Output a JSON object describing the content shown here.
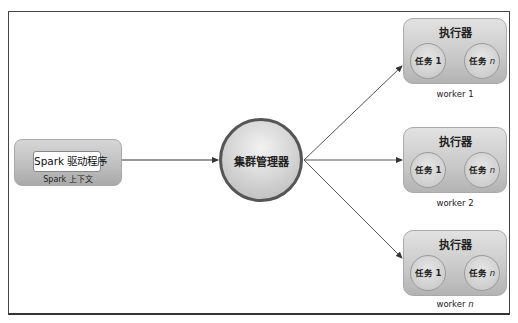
{
  "diagram": {
    "type": "spark-cluster-architecture",
    "driver": {
      "program_label": "Spark 驱动程序",
      "context_label": "Spark 上下文"
    },
    "cluster_manager": {
      "label": "集群管理器"
    },
    "workers": [
      {
        "name": "worker 1",
        "name_prefix": "worker ",
        "name_suffix": "1",
        "suffix_italic": false,
        "executor_label": "执行器",
        "tasks": [
          {
            "prefix": "任务 ",
            "suffix": "1",
            "italic": false
          },
          {
            "prefix": "任务 ",
            "suffix": "n",
            "italic": true
          }
        ]
      },
      {
        "name": "worker 2",
        "name_prefix": "worker ",
        "name_suffix": "2",
        "suffix_italic": false,
        "executor_label": "执行器",
        "tasks": [
          {
            "prefix": "任务 ",
            "suffix": "1",
            "italic": false
          },
          {
            "prefix": "任务 ",
            "suffix": "n",
            "italic": true
          }
        ]
      },
      {
        "name": "worker n",
        "name_prefix": "worker ",
        "name_suffix": "n",
        "suffix_italic": true,
        "executor_label": "执行器",
        "tasks": [
          {
            "prefix": "任务 ",
            "suffix": "1",
            "italic": false
          },
          {
            "prefix": "任务 ",
            "suffix": "n",
            "italic": true
          }
        ]
      }
    ],
    "edges": [
      {
        "from": "driver",
        "to": "cluster_manager"
      },
      {
        "from": "cluster_manager",
        "to": "worker 1"
      },
      {
        "from": "cluster_manager",
        "to": "worker 2"
      },
      {
        "from": "cluster_manager",
        "to": "worker n"
      }
    ],
    "colors": {
      "frame_border": "#444444",
      "node_fill": "#c8c8c8",
      "cluster_manager_border": "#555555",
      "arrow": "#333333"
    }
  }
}
